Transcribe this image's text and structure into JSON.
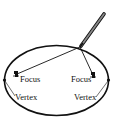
{
  "diagram": {
    "labels": {
      "focus_left": "Focus",
      "focus_right": "Focus",
      "vertex_left": "Vertex",
      "vertex_right": "Vertex"
    },
    "icons": {
      "pencil": "pencil-icon",
      "pin_left": "pin-icon",
      "pin_right": "pin-icon"
    },
    "colors": {
      "stroke": "#111111",
      "background": "#ffffff",
      "pencil_body": "#555555"
    }
  }
}
